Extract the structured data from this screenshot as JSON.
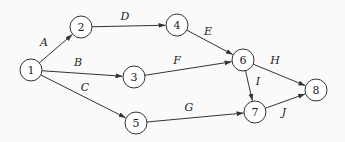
{
  "diagram": {
    "type": "activity-network",
    "node_radius": 11,
    "colors": {
      "background": "#fafafa",
      "stroke": "#333333",
      "text": "#222222"
    },
    "nodes": [
      {
        "id": "1",
        "label": "1",
        "x": 31,
        "y": 70
      },
      {
        "id": "2",
        "label": "2",
        "x": 81,
        "y": 27
      },
      {
        "id": "3",
        "label": "3",
        "x": 134,
        "y": 77
      },
      {
        "id": "4",
        "label": "4",
        "x": 177,
        "y": 25
      },
      {
        "id": "5",
        "label": "5",
        "x": 136,
        "y": 123
      },
      {
        "id": "6",
        "label": "6",
        "x": 243,
        "y": 60
      },
      {
        "id": "7",
        "label": "7",
        "x": 255,
        "y": 112
      },
      {
        "id": "8",
        "label": "8",
        "x": 316,
        "y": 90
      }
    ],
    "edges": [
      {
        "label": "A",
        "from": "1",
        "to": "2",
        "lx": 44,
        "ly": 42
      },
      {
        "label": "B",
        "from": "1",
        "to": "3",
        "lx": 78,
        "ly": 62
      },
      {
        "label": "C",
        "from": "1",
        "to": "5",
        "lx": 85,
        "ly": 87
      },
      {
        "label": "D",
        "from": "2",
        "to": "4",
        "lx": 125,
        "ly": 16
      },
      {
        "label": "E",
        "from": "4",
        "to": "6",
        "lx": 208,
        "ly": 31
      },
      {
        "label": "F",
        "from": "3",
        "to": "6",
        "lx": 177,
        "ly": 60
      },
      {
        "label": "G",
        "from": "5",
        "to": "7",
        "lx": 189,
        "ly": 107
      },
      {
        "label": "H",
        "from": "6",
        "to": "8",
        "lx": 275,
        "ly": 60
      },
      {
        "label": "I",
        "from": "6",
        "to": "7",
        "lx": 258,
        "ly": 81
      },
      {
        "label": "J",
        "from": "7",
        "to": "8",
        "lx": 284,
        "ly": 112
      }
    ]
  }
}
